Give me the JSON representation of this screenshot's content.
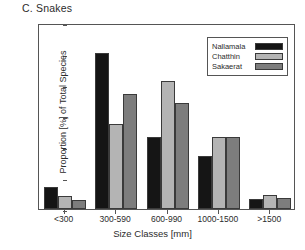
{
  "panel": {
    "title": "C. Snakes"
  },
  "axes": {
    "ylabel": "Proportion [%] of Total Species",
    "xlabel": "Size Classes [mm]",
    "yticks": [
      "0",
      "10",
      "20",
      "30",
      "40",
      "50",
      "60"
    ]
  },
  "legend": {
    "items": [
      {
        "label": "Nallamala",
        "color": "#151515"
      },
      {
        "label": "Chatthin",
        "color": "#b4b4b4"
      },
      {
        "label": "Sakaerat",
        "color": "#7d7d7d"
      }
    ]
  },
  "chart_data": {
    "type": "bar",
    "title": "C. Snakes",
    "xlabel": "Size Classes [mm]",
    "ylabel": "Proportion [%] of Total Species",
    "ylim": [
      0,
      60
    ],
    "ytick_values": [
      0,
      10,
      20,
      30,
      40,
      50,
      60
    ],
    "grid": false,
    "legend_position": "top-right",
    "categories": [
      "<300",
      "300-590",
      "600-990",
      "1000-1500",
      ">1500"
    ],
    "series": [
      {
        "name": "Nallamala",
        "color": "#151515",
        "values": [
          7.0,
          50.2,
          23.2,
          17.2,
          3.2
        ]
      },
      {
        "name": "Chatthin",
        "color": "#b4b4b4",
        "values": [
          4.1,
          27.3,
          41.2,
          23.1,
          4.4
        ]
      },
      {
        "name": "Sakaerat",
        "color": "#7d7d7d",
        "values": [
          3.0,
          37.1,
          34.2,
          23.3,
          3.4
        ]
      }
    ]
  }
}
